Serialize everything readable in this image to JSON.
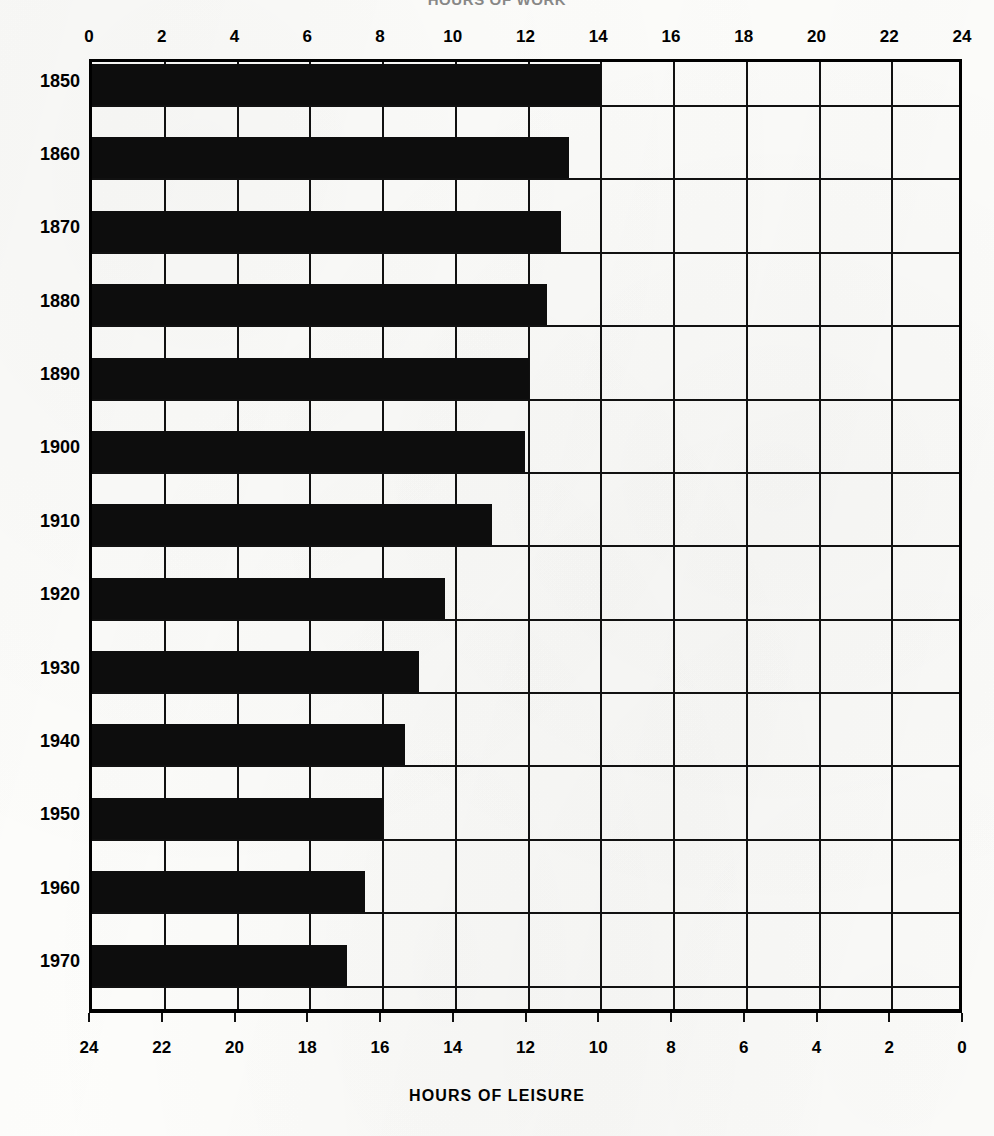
{
  "titles": {
    "top": "HOURS OF WORK",
    "bottom": "HOURS OF LEISURE"
  },
  "chart_data": {
    "type": "bar",
    "orientation": "horizontal",
    "title": "HOURS OF WORK",
    "xlabel": "HOURS OF LEISURE",
    "ylabel": "",
    "categories": [
      "1850",
      "1860",
      "1870",
      "1880",
      "1890",
      "1900",
      "1910",
      "1920",
      "1930",
      "1940",
      "1950",
      "1960",
      "1970"
    ],
    "values": [
      14.0,
      13.1,
      12.9,
      12.5,
      12.0,
      11.9,
      11.0,
      9.7,
      9.0,
      8.6,
      8.0,
      7.5,
      7.0
    ],
    "value_unit": "hours of work per day",
    "leisure_values": [
      10.0,
      10.9,
      11.1,
      11.5,
      12.0,
      12.1,
      13.0,
      14.3,
      15.0,
      15.4,
      16.0,
      16.5,
      17.0
    ],
    "xlim": [
      0,
      24
    ],
    "top_axis": {
      "label": "HOURS OF WORK",
      "direction": "left-to-right",
      "ticks": [
        0,
        2,
        4,
        6,
        8,
        10,
        12,
        14,
        16,
        18,
        20,
        22,
        24
      ],
      "tick_labels": [
        "0",
        "2",
        "4",
        "6",
        "8",
        "10",
        "12",
        "14",
        "16",
        "18",
        "20",
        "22",
        "24"
      ]
    },
    "bottom_axis": {
      "label": "HOURS OF LEISURE",
      "direction": "right-to-left",
      "ticks": [
        24,
        22,
        20,
        18,
        16,
        14,
        12,
        10,
        8,
        6,
        4,
        2,
        0
      ],
      "tick_labels": [
        "24",
        "22",
        "20",
        "18",
        "16",
        "14",
        "12",
        "10",
        "8",
        "6",
        "4",
        "2",
        "0"
      ]
    },
    "grid": true,
    "grid_axis": "x",
    "grid_interval": 2,
    "legend": null,
    "bar_color": "#0d0d0d",
    "background_color": "#fcfcfa"
  }
}
